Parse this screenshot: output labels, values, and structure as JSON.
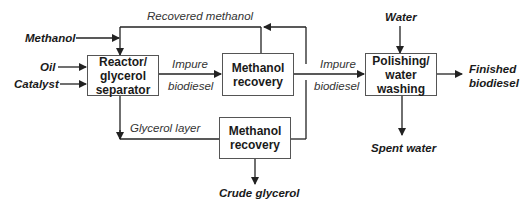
{
  "inputs": {
    "methanol": "Methanol",
    "oil": "Oil",
    "catalyst": "Catalyst",
    "water": "Water"
  },
  "boxes": {
    "reactor": "Reactor/ glycerol separator",
    "methanol_recovery_top": "Methanol recovery",
    "methanol_recovery_bottom": "Methanol recovery",
    "polishing": "Polishing/ water washing"
  },
  "flows": {
    "recovered_methanol": "Recovered methanol",
    "impure_1": "Impure",
    "biodiesel_1": "biodiesel",
    "impure_2": "Impure",
    "biodiesel_2": "biodiesel",
    "glycerol_layer": "Glycerol layer"
  },
  "outputs": {
    "finished_1": "Finished",
    "finished_2": "biodiesel",
    "spent_water": "Spent water",
    "crude_glycerol": "Crude glycerol"
  },
  "colors": {
    "line": "#222222",
    "box_border": "#555555"
  }
}
